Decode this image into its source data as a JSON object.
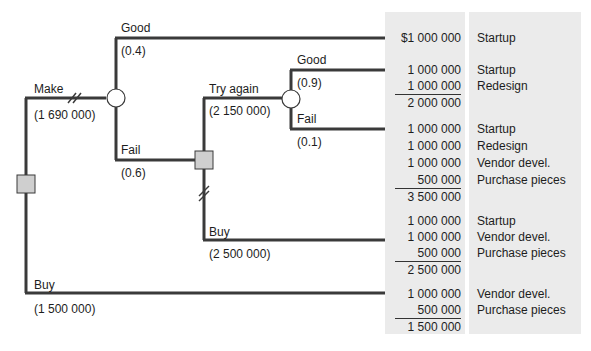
{
  "tree": {
    "decision_root": {
      "type": "decision"
    },
    "branches": {
      "make": {
        "label": "Make",
        "value": "(1 690 000)"
      },
      "buy": {
        "label": "Buy",
        "value": "(1 500 000)"
      },
      "good": {
        "label": "Good",
        "prob": "(0.4)"
      },
      "fail": {
        "label": "Fail",
        "prob": "(0.6)"
      },
      "try_again": {
        "label": "Try again",
        "value": "(2 150 000)"
      },
      "buy2": {
        "label": "Buy",
        "value": "(2 500 000)"
      },
      "good2": {
        "label": "Good",
        "prob": "(0.9)"
      },
      "fail2": {
        "label": "Fail",
        "prob": "(0.1)"
      }
    }
  },
  "outcomes": [
    {
      "rows": [
        {
          "amount": "$1 000 000",
          "desc": "Startup"
        }
      ]
    },
    {
      "rows": [
        {
          "amount": "1 000 000",
          "desc": "Startup"
        },
        {
          "amount": "1 000 000",
          "desc": "Redesign"
        }
      ],
      "total": "2 000 000"
    },
    {
      "rows": [
        {
          "amount": "1 000 000",
          "desc": "Startup"
        },
        {
          "amount": "1 000 000",
          "desc": "Redesign"
        },
        {
          "amount": "1 000 000",
          "desc": "Vendor devel."
        },
        {
          "amount": "500 000",
          "desc": "Purchase pieces"
        }
      ],
      "total": "3 500 000"
    },
    {
      "rows": [
        {
          "amount": "1 000 000",
          "desc": "Startup"
        },
        {
          "amount": "1 000 000",
          "desc": "Vendor devel."
        },
        {
          "amount": "500 000",
          "desc": "Purchase pieces"
        }
      ],
      "total": "2 500 000"
    },
    {
      "rows": [
        {
          "amount": "1 000 000",
          "desc": "Vendor devel."
        },
        {
          "amount": "500 000",
          "desc": "Purchase pieces"
        }
      ],
      "total": "1 500 000"
    }
  ],
  "colors": {
    "line": "#3a3a3a",
    "panel": "#ebebeb",
    "decision_fill": "#cfcfcf"
  }
}
